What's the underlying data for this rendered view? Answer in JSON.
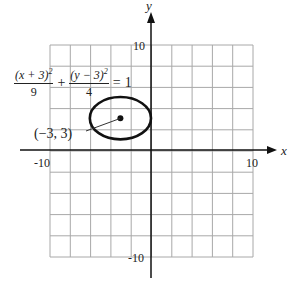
{
  "chart_data": {
    "type": "line",
    "title": "",
    "xlabel": "x",
    "ylabel": "y",
    "xlim": [
      -10,
      10
    ],
    "ylim": [
      -10,
      10
    ],
    "grid": true,
    "grid_step": 2,
    "x_tick_labels": [
      "-10",
      "10"
    ],
    "y_tick_labels": [
      "10",
      "-10"
    ],
    "equation": {
      "term1_numerator": "(x + 3)",
      "term1_exponent": "2",
      "term1_denominator": "9",
      "plus": "+",
      "term2_numerator": "(y − 3)",
      "term2_exponent": "2",
      "term2_denominator": "4",
      "equals": "=",
      "rhs": "1"
    },
    "ellipse": {
      "center": [
        -3,
        3
      ],
      "a": 3,
      "b": 2
    },
    "annotations": [
      {
        "text": "(−3, 3)",
        "point": [
          -3,
          3
        ]
      }
    ],
    "colors": {
      "grid": "#a8a8a8",
      "axis": "#111111",
      "curve": "#111111"
    }
  }
}
